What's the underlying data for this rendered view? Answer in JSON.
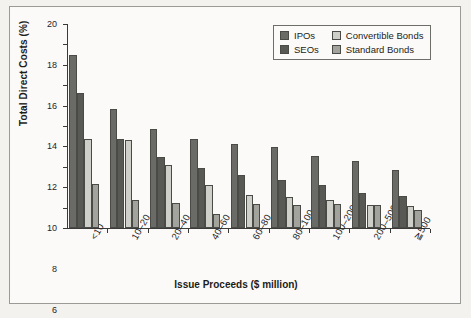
{
  "chart_data": {
    "type": "bar",
    "title": "",
    "xlabel": "Issue Proceeds ($ million)",
    "ylabel": "Total Direct Costs (%)",
    "ylim": [
      0,
      20
    ],
    "yticks": [
      0,
      2,
      4,
      6,
      8,
      10,
      12,
      14,
      16,
      18,
      20
    ],
    "ytick_labels": [
      "0",
      "2",
      "4",
      "6",
      "8",
      "10",
      "12",
      "14",
      "16",
      "18",
      "20"
    ],
    "grid": false,
    "legend_position": "top-right",
    "categories": [
      "<10",
      "10–20",
      "20–40",
      "40–60",
      "60–80",
      "80–100",
      "100–200",
      "200–500",
      "≧500"
    ],
    "series": [
      {
        "name": "IPOs",
        "color": "#6a6a66",
        "values": [
          16.96,
          11.63,
          9.7,
          8.72,
          8.2,
          7.91,
          7.06,
          6.53,
          5.72
        ]
      },
      {
        "name": "SEOs",
        "color": "#585854",
        "values": [
          13.28,
          8.72,
          6.93,
          5.87,
          5.18,
          4.73,
          4.22,
          3.47,
          3.15
        ]
      },
      {
        "name": "Convertible Bonds",
        "color": "#cfcfca",
        "values": [
          8.72,
          8.63,
          6.13,
          4.25,
          3.22,
          3.06,
          2.78,
          2.21,
          2.15
        ]
      },
      {
        "name": "Standard Bonds",
        "color": "#a3a39e",
        "values": [
          4.31,
          2.74,
          2.42,
          1.37,
          2.34,
          2.21,
          2.32,
          2.24,
          1.76
        ]
      }
    ]
  },
  "legend": {
    "entries": [
      {
        "label": "IPOs"
      },
      {
        "label": "Convertible Bonds"
      },
      {
        "label": "SEOs"
      },
      {
        "label": "Standard Bonds"
      }
    ]
  }
}
